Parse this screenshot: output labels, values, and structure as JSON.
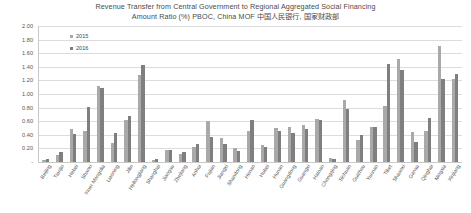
{
  "chart_data": {
    "type": "bar",
    "title": "Revenue Transfer from Central Government to Regional Aggregated Social Financing Amount Ratio (%) PBOC, China MOF 中国人民银行, 国家财政部",
    "title_lines": [
      "Revenue Transfer from Central Government to Regional Aggregated Social Financing",
      "Amount Ratio (%) PBOC, China MOF 中国人民银行, 国家财政部"
    ],
    "xlabel": "",
    "ylabel": "",
    "ylim": [
      0,
      2.0
    ],
    "ytick_step": 0.2,
    "ytick_labels": [
      "2.00",
      "1.80",
      "1.60",
      "1.40",
      "1.20",
      "1.00",
      "0.80",
      "0.60",
      "0.40",
      "0.20",
      "-"
    ],
    "grid": "horizontal",
    "legend_position": "inside-top-left",
    "categories": [
      "Beijing",
      "Tianjin",
      "Hebei",
      "Shanxi",
      "Inner Mongolia",
      "Liaoning",
      "Jilin",
      "Heilongjiang",
      "Shanghai",
      "Jiangsu",
      "Zhejiang",
      "Anhui",
      "Fujian",
      "Jiangxi",
      "Shandong",
      "Henan",
      "Hubei",
      "Hunan",
      "Guangdong",
      "Guangxi",
      "Hainan",
      "Chongqing",
      "Sichuan",
      "Guizhou",
      "Yunnan",
      "Tibet",
      "Shaanxi",
      "Gansu",
      "Qinghai",
      "Ningxia",
      "Xinjiang"
    ],
    "series": [
      {
        "name": "2015",
        "color": "#a9a9a9",
        "values": [
          0.03,
          0.1,
          0.49,
          0.46,
          1.12,
          0.28,
          0.62,
          1.28,
          0.03,
          0.17,
          0.12,
          0.22,
          0.61,
          0.36,
          0.2,
          0.46,
          0.25,
          0.5,
          0.52,
          0.54,
          0.63,
          0.06,
          0.91,
          0.33,
          0.52,
          0.82,
          1.51,
          0.44,
          0.45,
          1.71,
          1.22
        ]
      },
      {
        "name": "2016",
        "color": "#7f7f7f",
        "values": [
          0.05,
          0.15,
          0.41,
          0.81,
          1.09,
          0.42,
          0.67,
          1.43,
          0.04,
          0.18,
          0.15,
          0.26,
          0.37,
          0.27,
          0.16,
          0.62,
          0.22,
          0.46,
          0.42,
          0.48,
          0.62,
          0.05,
          0.78,
          0.4,
          0.52,
          1.44,
          1.35,
          0.3,
          0.64,
          1.22,
          1.3
        ]
      }
    ]
  }
}
